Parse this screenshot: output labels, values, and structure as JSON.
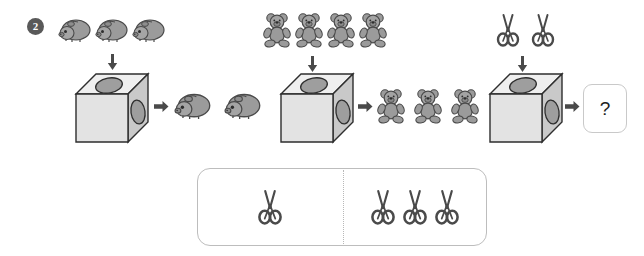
{
  "worksheet": {
    "problem_number": "2",
    "question_mark": "?"
  },
  "colors": {
    "animal_fill": "#9b9b9b",
    "animal_stroke": "#4a4a4a",
    "box_front": "#e3e3e3",
    "box_top": "#efefef",
    "box_side": "#c9c9c9",
    "box_stroke": "#2e2e2e",
    "hole_fill": "#9e9e9e",
    "arrow": "#4a4a4a",
    "panel_border": "#bdbdbd",
    "badge": "#595959"
  },
  "groups": [
    {
      "id": "guinea-pig",
      "icon": "guinea-pig-icon",
      "input_label": "3 guinea pigs in",
      "input_count": 3,
      "machine_label": "machine-box",
      "output_label": "2 guinea pigs out",
      "output_count": 2
    },
    {
      "id": "teddy-bear",
      "icon": "teddy-bear-icon",
      "input_label": "4 teddy bears in",
      "input_count": 4,
      "machine_label": "machine-box",
      "output_label": "3 teddy bears out",
      "output_count": 3
    },
    {
      "id": "scissors",
      "icon": "scissors-icon",
      "input_label": "2 scissors in",
      "input_count": 2,
      "machine_label": "machine-box",
      "output_label": "unknown",
      "output_count": 0
    }
  ],
  "answer_options": [
    {
      "id": "option-left",
      "icon": "scissors-icon",
      "count": 1
    },
    {
      "id": "option-right",
      "icon": "scissors-icon",
      "count": 3
    }
  ]
}
